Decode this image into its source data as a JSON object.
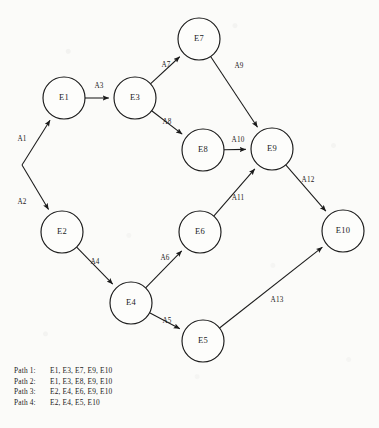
{
  "diagram": {
    "background_color": "#fbfbf9",
    "ink_color": "#1a1a1a",
    "node_radius": 21,
    "nodes": [
      {
        "id": "E1",
        "label": "E1",
        "x": 64,
        "y": 98
      },
      {
        "id": "E2",
        "label": "E2",
        "x": 62,
        "y": 232
      },
      {
        "id": "E3",
        "label": "E3",
        "x": 135,
        "y": 98
      },
      {
        "id": "E4",
        "label": "E4",
        "x": 131,
        "y": 303
      },
      {
        "id": "E5",
        "label": "E5",
        "x": 203,
        "y": 341
      },
      {
        "id": "E6",
        "label": "E6",
        "x": 200,
        "y": 232
      },
      {
        "id": "E7",
        "label": "E7",
        "x": 199,
        "y": 39
      },
      {
        "id": "E8",
        "label": "E8",
        "x": 203,
        "y": 150
      },
      {
        "id": "E9",
        "label": "E9",
        "x": 272,
        "y": 149
      },
      {
        "id": "E10",
        "label": "E10",
        "x": 343,
        "y": 231
      }
    ],
    "origin_vertex": {
      "id": "start",
      "x": 22,
      "y": 165
    },
    "edges": [
      {
        "id": "A1",
        "label": "A1",
        "from": "start",
        "to": "E1",
        "label_x": 22,
        "label_y": 139
      },
      {
        "id": "A2",
        "label": "A2",
        "from": "start",
        "to": "E2",
        "label_x": 22,
        "label_y": 202
      },
      {
        "id": "A3",
        "label": "A3",
        "from": "E1",
        "to": "E3",
        "label_x": 99,
        "label_y": 86
      },
      {
        "id": "A4",
        "label": "A4",
        "from": "E2",
        "to": "E4",
        "label_x": 95,
        "label_y": 262
      },
      {
        "id": "A5",
        "label": "A5",
        "from": "E4",
        "to": "E5",
        "label_x": 167,
        "label_y": 321
      },
      {
        "id": "A6",
        "label": "A6",
        "from": "E4",
        "to": "E6",
        "label_x": 165,
        "label_y": 258
      },
      {
        "id": "A7",
        "label": "A7",
        "from": "E3",
        "to": "E7",
        "label_x": 166,
        "label_y": 65
      },
      {
        "id": "A8",
        "label": "A8",
        "from": "E3",
        "to": "E8",
        "label_x": 167,
        "label_y": 122
      },
      {
        "id": "A9",
        "label": "A9",
        "from": "E7",
        "to": "E9",
        "label_x": 239,
        "label_y": 66
      },
      {
        "id": "A10",
        "label": "A10",
        "from": "E8",
        "to": "E9",
        "label_x": 238,
        "label_y": 140
      },
      {
        "id": "A11",
        "label": "A11",
        "from": "E6",
        "to": "E9",
        "label_x": 238,
        "label_y": 198
      },
      {
        "id": "A12",
        "label": "A12",
        "from": "E9",
        "to": "E10",
        "label_x": 308,
        "label_y": 180
      },
      {
        "id": "A13",
        "label": "A13",
        "from": "E5",
        "to": "E10",
        "label_x": 277,
        "label_y": 300
      }
    ]
  },
  "legend": {
    "rows": [
      {
        "name": "Path 1:",
        "sequence": "E1, E3, E7, E9, E10"
      },
      {
        "name": "Path 2:",
        "sequence": "E1, E3, E8, E9, E10"
      },
      {
        "name": "Path 3:",
        "sequence": "E2, E4, E6, E9, E10"
      },
      {
        "name": "Path 4:",
        "sequence": "E2, E4, E5, E10"
      }
    ]
  }
}
